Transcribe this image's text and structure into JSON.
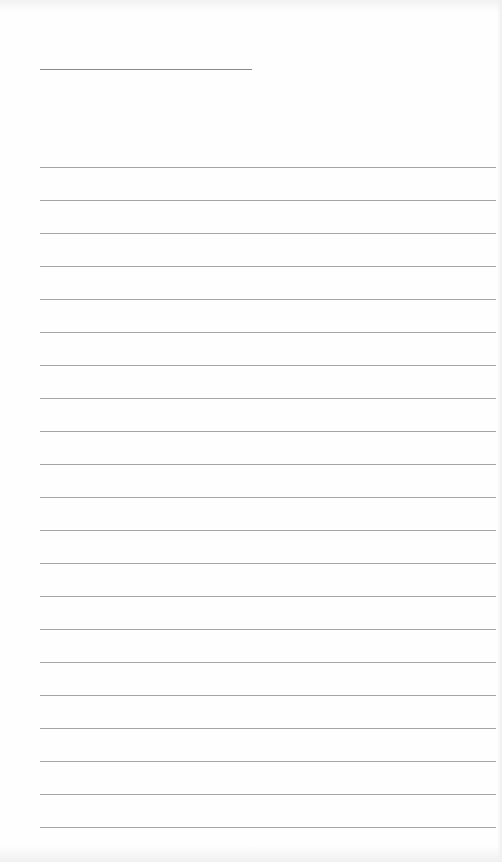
{
  "page": {
    "type": "blank-lined-sheet",
    "background_color": "#fefefe",
    "title_line": {
      "x": 40,
      "y": 69,
      "width": 212,
      "color": "#8a8a8a"
    },
    "rules": {
      "count": 21,
      "start_y": 167,
      "spacing": 33,
      "x": 40,
      "width": 456,
      "color": "#a6a6a6"
    }
  }
}
